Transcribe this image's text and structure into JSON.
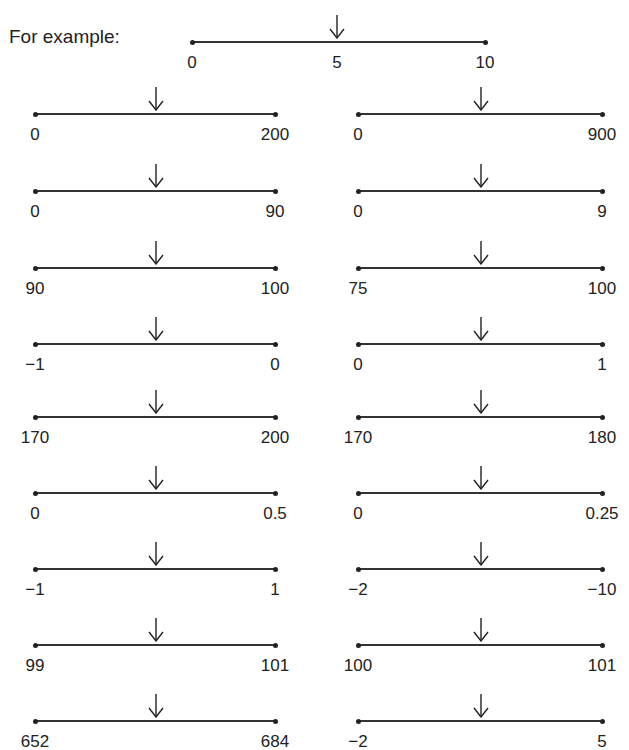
{
  "intro": "For example:",
  "example": {
    "left": "0",
    "mid": "5",
    "right": "10"
  },
  "left_column": [
    {
      "left": "0",
      "right": "200"
    },
    {
      "left": "0",
      "right": "90"
    },
    {
      "left": "90",
      "right": "100"
    },
    {
      "left": "−1",
      "right": "0"
    },
    {
      "left": "170",
      "right": "200"
    },
    {
      "left": "0",
      "right": "0.5"
    },
    {
      "left": "−1",
      "right": "1"
    },
    {
      "left": "99",
      "right": "101"
    },
    {
      "left": "652",
      "right": "684"
    }
  ],
  "right_column": [
    {
      "left": "0",
      "right": "900"
    },
    {
      "left": "0",
      "right": "9"
    },
    {
      "left": "75",
      "right": "100"
    },
    {
      "left": "0",
      "right": "1"
    },
    {
      "left": "170",
      "right": "180"
    },
    {
      "left": "0",
      "right": "0.25"
    },
    {
      "left": "−2",
      "right": "−10"
    },
    {
      "left": "100",
      "right": "101"
    },
    {
      "left": "−2",
      "right": "5"
    }
  ],
  "icons": {
    "marker": "down-arrow-icon"
  }
}
